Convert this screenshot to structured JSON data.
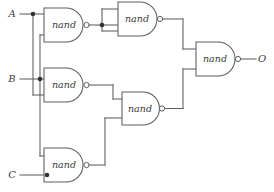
{
  "diagram": {
    "type": "logic-circuit-schematic",
    "colors": {
      "wire": "#5c5c5c",
      "gate_outline": "#5c5c5c",
      "gate_fill": "#ffffff",
      "junction": "#333333",
      "text": "#3a3a3a",
      "background": "#ffffff"
    },
    "inputs": [
      {
        "id": "A",
        "label": "A",
        "x": 12,
        "y": 14
      },
      {
        "id": "B",
        "label": "B",
        "x": 12,
        "y": 79
      },
      {
        "id": "C",
        "label": "C",
        "x": 12,
        "y": 175
      }
    ],
    "outputs": [
      {
        "id": "O",
        "label": "O",
        "x": 262,
        "y": 67
      }
    ],
    "gates": [
      {
        "id": "g1",
        "label": "nand",
        "x": 44,
        "y": 8,
        "w": 44,
        "h": 34,
        "inputs": [
          "A",
          "B"
        ],
        "cx": 64,
        "cy": 25
      },
      {
        "id": "g2",
        "label": "nand",
        "x": 118,
        "y": 2,
        "w": 39,
        "h": 34,
        "inputs": [
          "g1",
          "g1"
        ],
        "cx": 136,
        "cy": 19
      },
      {
        "id": "g3",
        "label": "nand",
        "x": 44,
        "y": 68,
        "w": 44,
        "h": 34,
        "inputs": [
          "B",
          "A"
        ],
        "cx": 64,
        "cy": 85
      },
      {
        "id": "g4",
        "label": "nand",
        "x": 122,
        "y": 92,
        "w": 38,
        "h": 33,
        "inputs": [
          "g3",
          "g5"
        ],
        "cx": 140,
        "cy": 108
      },
      {
        "id": "g5",
        "label": "nand",
        "x": 44,
        "y": 148,
        "w": 44,
        "h": 34,
        "inputs": [
          "B",
          "C"
        ],
        "cx": 64,
        "cy": 165
      },
      {
        "id": "g6",
        "label": "nand",
        "x": 196,
        "y": 42,
        "w": 39,
        "h": 34,
        "inputs": [
          "g2",
          "g4"
        ],
        "cx": 214,
        "cy": 59
      }
    ],
    "junctions": [
      {
        "id": "j-a",
        "x": 33,
        "y": 14,
        "net": "A"
      },
      {
        "id": "j-b",
        "x": 40,
        "y": 79,
        "net": "B"
      },
      {
        "id": "j-c",
        "x": 47,
        "y": 175,
        "net": "C"
      },
      {
        "id": "j-g1out",
        "x": 102,
        "y": 25,
        "net": "g1"
      }
    ],
    "nets": [
      {
        "id": "A",
        "from": "A",
        "to": [
          "g1.in1",
          "g3.in2"
        ]
      },
      {
        "id": "B",
        "from": "B",
        "to": [
          "g1.in2",
          "g3.in1",
          "g5.in1"
        ]
      },
      {
        "id": "C",
        "from": "C",
        "to": [
          "g5.in2"
        ]
      },
      {
        "id": "g1",
        "from": "g1.out",
        "to": [
          "g2.in1",
          "g2.in2"
        ]
      },
      {
        "id": "g2",
        "from": "g2.out",
        "to": [
          "g6.in1"
        ]
      },
      {
        "id": "g3",
        "from": "g3.out",
        "to": [
          "g4.in1"
        ]
      },
      {
        "id": "g5",
        "from": "g5.out",
        "to": [
          "g4.in2"
        ]
      },
      {
        "id": "g4",
        "from": "g4.out",
        "to": [
          "g6.in2"
        ]
      },
      {
        "id": "O",
        "from": "g6.out",
        "to": [
          "O"
        ]
      }
    ]
  }
}
